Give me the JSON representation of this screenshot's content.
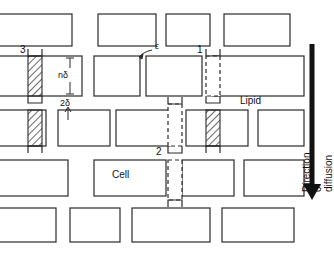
{
  "figure": {
    "type": "schematic-diagram",
    "background_color": "#ffffff",
    "line_color": "#2b2b2b",
    "hatch_color": "#2b2b2b"
  },
  "labels": {
    "path_1": "1",
    "path_2": "2",
    "path_3": "3",
    "lipid": "Lipid",
    "cell": "Cell",
    "dim_n_delta": "nδ",
    "dim_2_delta": "2δ",
    "epsilon": "ε",
    "direction": "Direction of diffusion"
  },
  "legend_meaning": {
    "path_1": "transcellular-lipid pathway marker",
    "path_2": "intercellular dashed pathway marker",
    "path_3": "lateral hatched pathway marker",
    "dim_n_delta": "vertical cell height dimension",
    "dim_2_delta": "lipid gap thickness dimension",
    "epsilon": "slit width between adjacent cells"
  },
  "chart_data": {
    "type": "diagram",
    "title": "",
    "rows": [
      {
        "index": 0,
        "y": 14,
        "height": 32,
        "bricks": [
          {
            "x": -18,
            "w": 90
          },
          {
            "x": 98,
            "w": 58
          },
          {
            "x": 166,
            "w": 44
          },
          {
            "x": 224,
            "w": 66
          }
        ]
      },
      {
        "index": 1,
        "y": 56,
        "height": 40,
        "bricks": [
          {
            "x": -18,
            "w": 100
          },
          {
            "x": 94,
            "w": 46
          },
          {
            "x": 146,
            "w": 56
          },
          {
            "x": 212,
            "w": 92
          }
        ]
      },
      {
        "index": 2,
        "y": 110,
        "height": 36,
        "bricks": [
          {
            "x": -18,
            "w": 64
          },
          {
            "x": 58,
            "w": 52
          },
          {
            "x": 116,
            "w": 54
          },
          {
            "x": 186,
            "w": 62
          },
          {
            "x": 258,
            "w": 46
          }
        ]
      },
      {
        "index": 3,
        "y": 160,
        "height": 36,
        "bricks": [
          {
            "x": -18,
            "w": 86
          },
          {
            "x": 94,
            "w": 72
          },
          {
            "x": 182,
            "w": 52
          },
          {
            "x": 244,
            "w": 60
          }
        ]
      },
      {
        "index": 4,
        "y": 208,
        "height": 34,
        "bricks": [
          {
            "x": -18,
            "w": 74
          },
          {
            "x": 70,
            "w": 50
          },
          {
            "x": 132,
            "w": 78
          },
          {
            "x": 222,
            "w": 72
          }
        ]
      }
    ],
    "columns": [
      {
        "name": "path_3",
        "x": 28,
        "w": 14,
        "segments": [
          {
            "from_y": 56,
            "to_y": 96,
            "style": "hatched"
          },
          {
            "from_y": 110,
            "to_y": 146,
            "style": "hatched"
          }
        ],
        "caps": [
          "top",
          "middle",
          "bottom"
        ]
      },
      {
        "name": "path_1",
        "x": 206,
        "w": 14,
        "segments": [
          {
            "from_y": 56,
            "to_y": 96,
            "style": "dashed"
          },
          {
            "from_y": 110,
            "to_y": 146,
            "style": "hatched"
          }
        ],
        "caps": [
          "top",
          "middle",
          "bottom"
        ]
      },
      {
        "name": "path_2",
        "x": 168,
        "w": 14,
        "segments": [
          {
            "from_y": 104,
            "to_y": 146,
            "style": "dashed"
          },
          {
            "from_y": 160,
            "to_y": 200,
            "style": "dashed"
          }
        ],
        "caps": [
          "top",
          "middle",
          "bottom"
        ]
      }
    ],
    "arrow": {
      "name": "direction-of-diffusion",
      "x": 312,
      "from_y": 44,
      "to_y": 200,
      "orientation": "down"
    }
  }
}
